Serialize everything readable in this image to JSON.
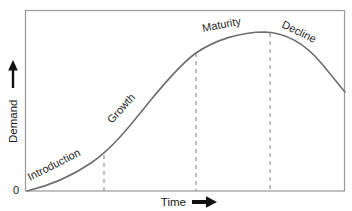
{
  "figure": {
    "background_color": "#fefefe",
    "frame_color": "#9a9a9a",
    "curve_color": "#6e6e6e",
    "dash_color": "#8c8c8c",
    "text_color": "#1a1a1a"
  },
  "axes": {
    "y_label": "Demand",
    "y_origin_label": "0",
    "y_arrow_icon": "arrow-up-icon",
    "x_label": "Time",
    "x_arrow_icon": "arrow-right-icon"
  },
  "stages": [
    {
      "label": "Introduction",
      "rotation": -27,
      "x": 30,
      "y": 181
    },
    {
      "label": "Growth",
      "rotation": -48,
      "x": 112,
      "y": 124
    },
    {
      "label": "Maturity",
      "rotation": -11,
      "x": 203,
      "y": 32
    },
    {
      "label": "Decline",
      "rotation": 26,
      "x": 281,
      "y": 27
    }
  ],
  "dividers": [
    {
      "name": "introduction-growth-divider",
      "x": 104,
      "y_top": 155,
      "y_bottom": 191
    },
    {
      "name": "growth-maturity-divider",
      "x": 196,
      "y_top": 53,
      "y_bottom": 191
    },
    {
      "name": "maturity-decline-divider",
      "x": 270,
      "y_top": 33,
      "y_bottom": 191
    }
  ],
  "chart_data": {
    "type": "line",
    "xlabel": "Time",
    "ylabel": "Demand",
    "grid": false,
    "legend": null,
    "xlim": [
      0,
      100
    ],
    "ylim": [
      0,
      100
    ],
    "axis_tick_labels": {
      "x": [],
      "y": [
        "0"
      ]
    },
    "annotations": [
      "Introduction",
      "Growth",
      "Maturity",
      "Decline"
    ],
    "stage_boundaries_x": [
      24.5,
      53.5,
      76.5
    ],
    "peak": {
      "x": 74.5,
      "y": 88
    },
    "series": [
      {
        "name": "Demand",
        "x": [
          0,
          5,
          10,
          15,
          20,
          24.5,
          30,
          35,
          40,
          45,
          50,
          53.5,
          58,
          62,
          66,
          70,
          74.5,
          76.5,
          80,
          85,
          90,
          95,
          100
        ],
        "y": [
          0,
          2,
          5,
          9,
          14,
          19,
          27,
          35,
          44,
          53,
          62,
          67,
          74,
          79,
          83,
          86,
          88,
          88,
          86,
          81,
          72,
          62,
          55
        ]
      }
    ]
  }
}
